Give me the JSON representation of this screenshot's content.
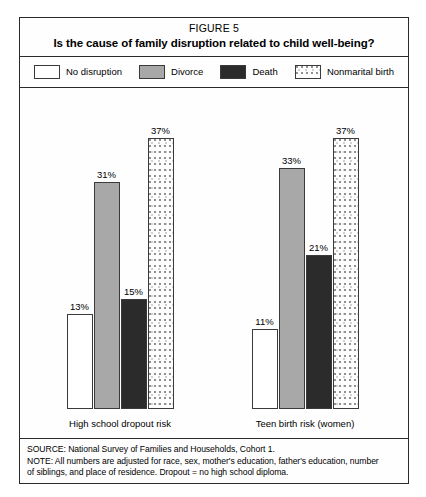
{
  "figure": {
    "number": "FIGURE 5",
    "title": "Is the cause of family disruption related to child well-being?"
  },
  "legend": {
    "items": [
      {
        "label": "No disruption",
        "swatch": "white-swatch",
        "color": "#ffffff"
      },
      {
        "label": "Divorce",
        "swatch": "gray-swatch",
        "color": "#a8a8a8"
      },
      {
        "label": "Death",
        "swatch": "black-swatch",
        "color": "#2b2b2b"
      },
      {
        "label": "Nonmarital birth",
        "swatch": "dotted-swatch",
        "color": "#fdfdfd"
      }
    ]
  },
  "footnote": {
    "source": "SOURCE: National Survey of Families and Households, Cohort 1.",
    "note_line_1": "NOTE: All numbers are adjusted for race, sex, mother's education, father's education, number",
    "note_line_2": "of siblings, and place of residence. Dropout = no high school diploma."
  },
  "chart_data": {
    "type": "bar",
    "title": "Is the cause of family disruption related to child well-being?",
    "subtitle": "FIGURE 5",
    "xlabel": "",
    "ylabel": "",
    "ylim": [
      0,
      40
    ],
    "grid": false,
    "legend_position": "top",
    "value_labels": true,
    "value_suffix": "%",
    "categories": [
      "High school dropout risk",
      "Teen birth risk (women)"
    ],
    "series": [
      {
        "name": "No disruption",
        "values": [
          13,
          11
        ],
        "labels": [
          "13%",
          "11%"
        ],
        "color": "#ffffff"
      },
      {
        "name": "Divorce",
        "values": [
          31,
          33
        ],
        "labels": [
          "31%",
          "33%"
        ],
        "color": "#a8a8a8"
      },
      {
        "name": "Death",
        "values": [
          15,
          21
        ],
        "labels": [
          "15%",
          "21%"
        ],
        "color": "#2b2b2b"
      },
      {
        "name": "Nonmarital birth",
        "values": [
          37,
          37
        ],
        "labels": [
          "37%",
          "37%"
        ],
        "color": "#fdfdfd"
      }
    ],
    "groups": [
      {
        "label": "High school dropout risk",
        "bars": [
          {
            "name": "No disruption",
            "value": 13,
            "label": "13%",
            "fill": "fill-none"
          },
          {
            "name": "Divorce",
            "value": 31,
            "label": "31%",
            "fill": "fill-divorce"
          },
          {
            "name": "Death",
            "value": 15,
            "label": "15%",
            "fill": "fill-death"
          },
          {
            "name": "Nonmarital birth",
            "value": 37,
            "label": "37%",
            "fill": "fill-nonmarital"
          }
        ]
      },
      {
        "label": "Teen birth risk (women)",
        "bars": [
          {
            "name": "No disruption",
            "value": 11,
            "label": "11%",
            "fill": "fill-none"
          },
          {
            "name": "Divorce",
            "value": 33,
            "label": "33%",
            "fill": "fill-divorce"
          },
          {
            "name": "Death",
            "value": 21,
            "label": "21%",
            "fill": "fill-death"
          },
          {
            "name": "Nonmarital birth",
            "value": 37,
            "label": "37%",
            "fill": "fill-nonmarital"
          }
        ]
      }
    ]
  }
}
